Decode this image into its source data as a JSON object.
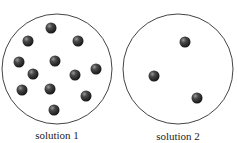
{
  "diagram": {
    "title": "",
    "solutions": [
      {
        "label": "solution 1",
        "particle_count": 12,
        "circle": {
          "cx": 57,
          "cy": 69,
          "r": 55
        },
        "particles": [
          {
            "x": 51,
            "y": 28
          },
          {
            "x": 28,
            "y": 41
          },
          {
            "x": 78,
            "y": 41
          },
          {
            "x": 19,
            "y": 62
          },
          {
            "x": 55,
            "y": 61
          },
          {
            "x": 96,
            "y": 69
          },
          {
            "x": 33,
            "y": 74
          },
          {
            "x": 75,
            "y": 75
          },
          {
            "x": 22,
            "y": 90
          },
          {
            "x": 50,
            "y": 89
          },
          {
            "x": 86,
            "y": 96
          },
          {
            "x": 54,
            "y": 110
          }
        ]
      },
      {
        "label": "solution 2",
        "particle_count": 3,
        "circle": {
          "cx": 178,
          "cy": 69,
          "r": 55
        },
        "particles": [
          {
            "x": 185,
            "y": 42
          },
          {
            "x": 154,
            "y": 76
          },
          {
            "x": 197,
            "y": 98
          }
        ]
      }
    ],
    "colors": {
      "circle_stroke": "#444444",
      "particle": "#2a2a2a",
      "particle_highlight": "#8a8a8a"
    }
  }
}
